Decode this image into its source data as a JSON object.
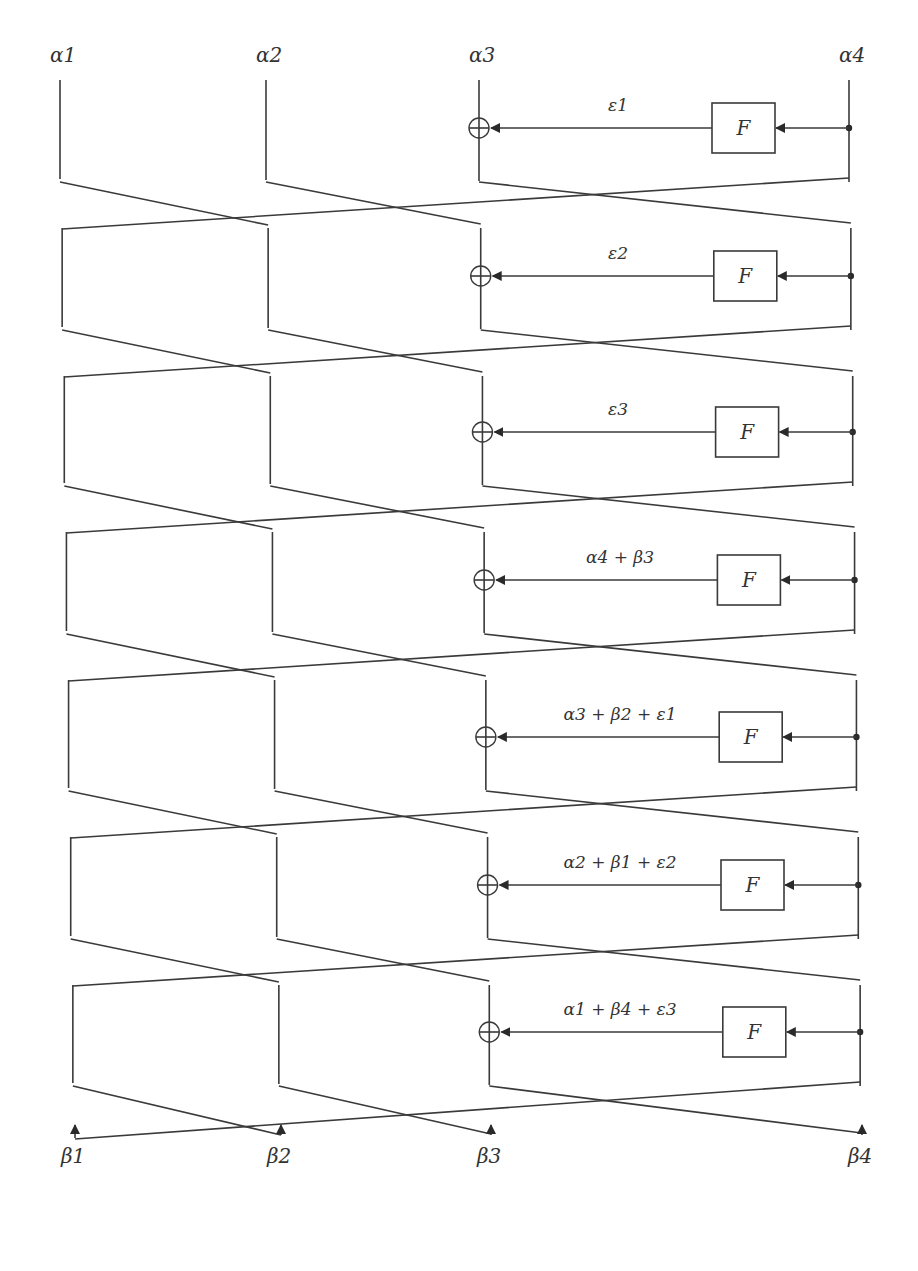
{
  "diagram": {
    "type": "generalized-feistel-network",
    "inputs": [
      "α1",
      "α2",
      "α3",
      "α4"
    ],
    "outputs": [
      "β1",
      "β2",
      "β3",
      "β4"
    ],
    "function_label": "F",
    "rounds": [
      {
        "index": 1,
        "label": "ε1",
        "y": 128
      },
      {
        "index": 2,
        "label": "ε2",
        "y": 276
      },
      {
        "index": 3,
        "label": "ε3",
        "y": 432
      },
      {
        "index": 4,
        "label": "α4 + β3",
        "y": 580
      },
      {
        "index": 5,
        "label": "α3 + β2 + ε1",
        "y": 737
      },
      {
        "index": 6,
        "label": "α2 + β1 + ε2",
        "y": 885
      },
      {
        "index": 7,
        "label": "α1 + β4 + ε3",
        "y": 1032
      }
    ]
  }
}
